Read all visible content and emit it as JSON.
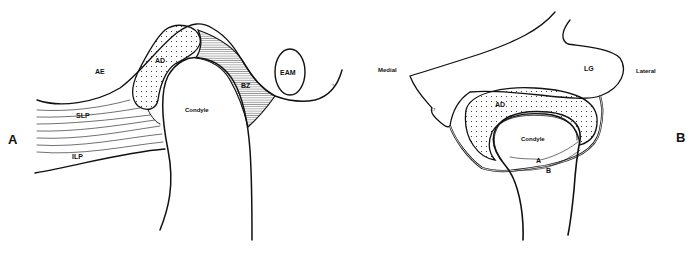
{
  "figure": {
    "panel_a": {
      "panel_label": "A",
      "labels": {
        "ae": "AE",
        "ad": "AD",
        "eam": "EAM",
        "bz": "BZ",
        "slp": "SLP",
        "ilp": "ILP",
        "condyle": "Condyle",
        "small_mark": "ᐧ>"
      }
    },
    "panel_b": {
      "panel_label": "B",
      "labels": {
        "medial": "Medial",
        "lateral": "Lateral",
        "lg": "LG",
        "ad": "AD",
        "condyle": "Condyle",
        "arrow_a": "A",
        "arrow_b": "B",
        "lt": "LT"
      }
    },
    "colors": {
      "line": "#111111",
      "background": "#ffffff"
    }
  }
}
